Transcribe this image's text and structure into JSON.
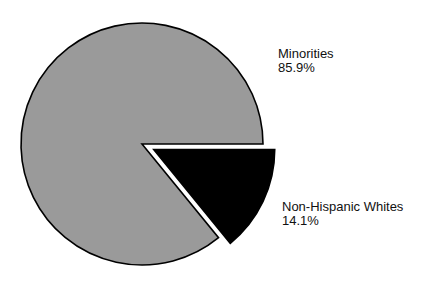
{
  "chart_data": {
    "type": "pie",
    "title": "",
    "categories": [
      "Minorities",
      "Non-Hispanic Whites"
    ],
    "values": [
      85.9,
      14.1
    ],
    "unit": "%",
    "colors": [
      "#9a9a9a",
      "#000000"
    ],
    "exploded": [
      false,
      true
    ],
    "labels": [
      {
        "name": "Minorities",
        "value_text": "85.9%"
      },
      {
        "name": "Non-Hispanic Whites",
        "value_text": "14.1%"
      }
    ],
    "legend": "none",
    "grid": false
  }
}
